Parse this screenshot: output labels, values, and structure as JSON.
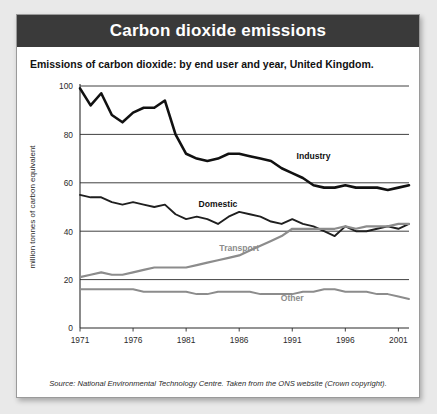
{
  "page": {
    "corner_note": "",
    "header_title": "Carbon dioxide emissions",
    "subtitle": "Emissions of carbon dioxide: by end user and year, United Kingdom.",
    "source": "Source: National Environmental Technology Centre. Taken from the ONS website (Crown copyright).",
    "header_bg": "#3a3a3a",
    "card_bg": "#ffffff",
    "page_bg": "#e9e9e9"
  },
  "chart_data": {
    "type": "line",
    "title": "Carbon dioxide emissions",
    "subtitle": "Emissions of carbon dioxide: by end user and year, United Kingdom.",
    "xlabel": "",
    "ylabel": "million tonnes of carbon equivalent",
    "xlim": [
      1971,
      2002
    ],
    "ylim": [
      0,
      100
    ],
    "yticks": [
      0,
      20,
      40,
      60,
      80,
      100
    ],
    "ytick_labels": [
      "0",
      "20",
      "40",
      "60",
      "80",
      "100"
    ],
    "xticks": [
      1971,
      1976,
      1981,
      1986,
      1991,
      1996,
      2001
    ],
    "xtick_labels": [
      "1971",
      "1976",
      "1981",
      "1986",
      "1991",
      "1996",
      "2001"
    ],
    "grid": "horizontal",
    "legend": "inline-labels",
    "x": [
      1971,
      1972,
      1973,
      1974,
      1975,
      1976,
      1977,
      1978,
      1979,
      1980,
      1981,
      1982,
      1983,
      1984,
      1985,
      1986,
      1987,
      1988,
      1989,
      1990,
      1991,
      1992,
      1993,
      1994,
      1995,
      1996,
      1997,
      1998,
      1999,
      2000,
      2001,
      2002
    ],
    "series": [
      {
        "name": "Industry",
        "color": "#111111",
        "width": 2.6,
        "label_x": 1993,
        "label_y": 70,
        "values": [
          99,
          92,
          97,
          88,
          85,
          89,
          91,
          91,
          94,
          80,
          72,
          70,
          69,
          70,
          72,
          72,
          71,
          70,
          69,
          66,
          64,
          62,
          59,
          58,
          58,
          59,
          58,
          58,
          58,
          57,
          58,
          59
        ]
      },
      {
        "name": "Domestic",
        "color": "#1f1f1f",
        "width": 1.9,
        "label_x": 1984,
        "label_y": 50,
        "values": [
          55,
          54,
          54,
          52,
          51,
          52,
          51,
          50,
          51,
          47,
          45,
          46,
          45,
          43,
          46,
          48,
          47,
          46,
          44,
          43,
          45,
          43,
          42,
          40,
          38,
          42,
          40,
          40,
          41,
          42,
          41,
          43
        ]
      },
      {
        "name": "Transport",
        "color": "#8c8c8c",
        "width": 2.2,
        "label_x": 1986,
        "label_y": 32,
        "values": [
          21,
          22,
          23,
          22,
          22,
          23,
          24,
          25,
          25,
          25,
          25,
          26,
          27,
          28,
          29,
          30,
          32,
          34,
          36,
          38,
          41,
          41,
          41,
          41,
          41,
          42,
          41,
          42,
          42,
          42,
          43,
          43
        ]
      },
      {
        "name": "Other",
        "color": "#8c8c8c",
        "width": 2.0,
        "label_x": 1991,
        "label_y": 11,
        "values": [
          16,
          16,
          16,
          16,
          16,
          16,
          15,
          15,
          15,
          15,
          15,
          14,
          14,
          15,
          15,
          15,
          15,
          14,
          14,
          14,
          14,
          15,
          15,
          16,
          16,
          15,
          15,
          15,
          14,
          14,
          13,
          12
        ]
      }
    ]
  }
}
